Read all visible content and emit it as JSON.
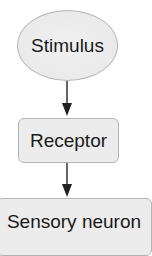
{
  "diagram": {
    "type": "flowchart",
    "direction": "top-to-bottom",
    "nodes": [
      {
        "id": "stimulus",
        "label": "Stimulus",
        "shape": "ellipse"
      },
      {
        "id": "receptor",
        "label": "Receptor",
        "shape": "rounded-rectangle"
      },
      {
        "id": "sensory_neuron",
        "label": "Sensory neuron",
        "shape": "rounded-rectangle"
      }
    ],
    "edges": [
      {
        "from": "stimulus",
        "to": "receptor"
      },
      {
        "from": "receptor",
        "to": "sensory_neuron"
      }
    ],
    "colors": {
      "node_fill": "#ececec",
      "node_border": "#b4b4b4",
      "arrow": "#333333",
      "text": "#1a1a1a"
    }
  }
}
